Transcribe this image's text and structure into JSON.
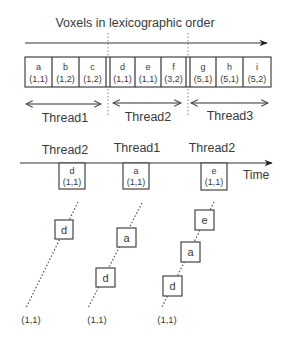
{
  "title": "Voxels in lexicographic order",
  "voxels": [
    {
      "letter": "a",
      "coord": "(1,1)"
    },
    {
      "letter": "b",
      "coord": "(1,2)"
    },
    {
      "letter": "c",
      "coord": "(1,2)"
    },
    {
      "letter": "d",
      "coord": "(1,1)"
    },
    {
      "letter": "e",
      "coord": "(1,1)"
    },
    {
      "letter": "f",
      "coord": "(3,2)"
    },
    {
      "letter": "g",
      "coord": "(5,1)"
    },
    {
      "letter": "h",
      "coord": "(5,1)"
    },
    {
      "letter": "i",
      "coord": "(5,2)"
    }
  ],
  "thread_ranges": [
    {
      "label": "Thread1"
    },
    {
      "label": "Thread2"
    },
    {
      "label": "Thread3"
    }
  ],
  "timeline": {
    "axis_label": "Time",
    "events": [
      {
        "thread": "Thread2",
        "letter": "d",
        "coord": "(1,1)"
      },
      {
        "thread": "Thread1",
        "letter": "a",
        "coord": "(1,1)"
      },
      {
        "thread": "Thread2",
        "letter": "e",
        "coord": "(1,1)"
      }
    ]
  },
  "stacks": [
    {
      "items": [
        "d"
      ],
      "base": "(1,1)"
    },
    {
      "items": [
        "a",
        "d"
      ],
      "base": "(1,1)"
    },
    {
      "items": [
        "e",
        "a",
        "d"
      ],
      "base": "(1,1)"
    }
  ]
}
